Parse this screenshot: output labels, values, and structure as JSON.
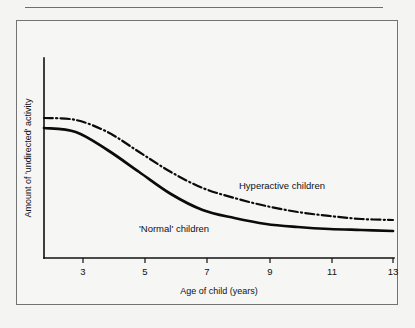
{
  "page": {
    "background_color": "#f4f4f3",
    "frame_color": "#737373",
    "ink_color": "#0b0b0b"
  },
  "chart_data": {
    "type": "line",
    "title": "",
    "subtitle": "",
    "xlabel": "Age of child (years)",
    "ylabel": "Amount of 'undirected' activity",
    "xlim": [
      2,
      13
    ],
    "ylim": [
      0,
      100
    ],
    "xticks": [
      3,
      5,
      7,
      9,
      11,
      13
    ],
    "xtick_labels": [
      "3",
      "5",
      "7",
      "9",
      "11",
      "13"
    ],
    "yticks": [],
    "ytick_labels": [],
    "grid": false,
    "legend": "inline-annotations",
    "legend_position": "on-plot",
    "x": [
      2,
      3,
      4,
      5,
      6,
      7,
      8,
      9,
      10,
      11,
      12,
      13
    ],
    "series": [
      {
        "name": "Hyperactive children",
        "style": "dash-dot",
        "color": "#0b0b0b",
        "label_text": "Hyperactive children",
        "values": [
          70,
          69,
          63,
          53,
          43,
          35,
          30,
          26,
          23,
          21,
          19.5,
          19
        ]
      },
      {
        "name": "'Normal' children",
        "style": "solid",
        "color": "#0b0b0b",
        "label_text": "'Normal' children",
        "values": [
          65,
          63,
          54,
          43,
          32,
          24,
          20,
          17,
          15.5,
          14.5,
          14,
          13.5
        ]
      }
    ],
    "annotations": [
      {
        "text": "Hyperactive children",
        "x": 7.1,
        "y": 38
      },
      {
        "text": "'Normal' children",
        "x": 4.4,
        "y": 18
      }
    ]
  }
}
